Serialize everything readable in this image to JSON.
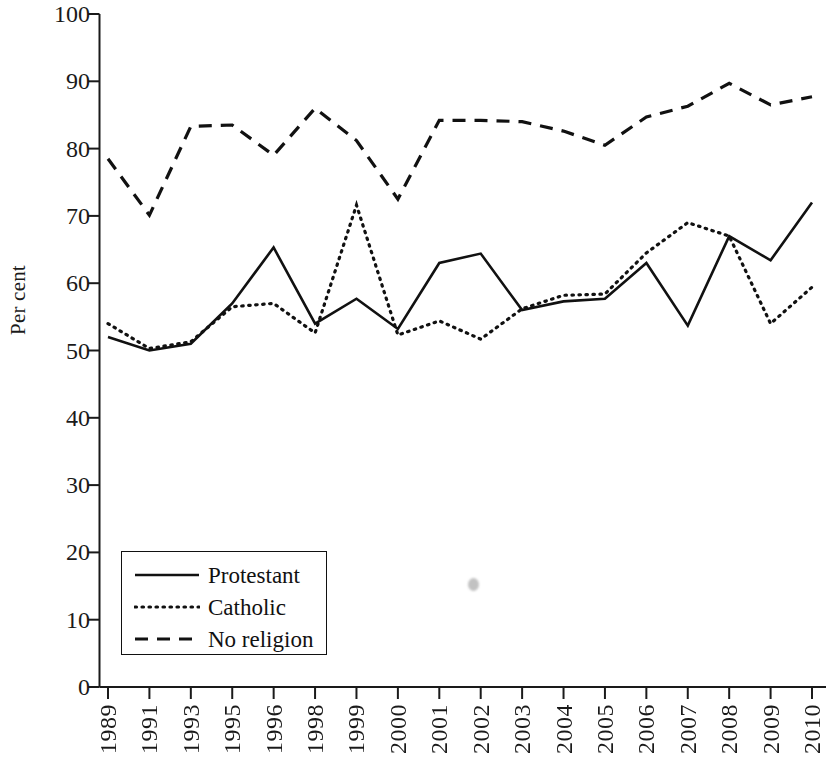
{
  "chart_data": {
    "type": "line",
    "title": "",
    "xlabel": "",
    "ylabel": "Per cent",
    "ylim": [
      0,
      100
    ],
    "ytick_values": [
      0,
      10,
      20,
      30,
      40,
      50,
      60,
      70,
      80,
      90,
      100
    ],
    "grid": false,
    "legend_position": "bottom-left",
    "categories": [
      "1989",
      "1991",
      "1993",
      "1995",
      "1996",
      "1998",
      "1999",
      "2000",
      "2001",
      "2002",
      "2003",
      "2004",
      "2005",
      "2006",
      "2007",
      "2008",
      "2009",
      "2010"
    ],
    "series": [
      {
        "name": "Protestant",
        "style": "solid",
        "color": "#111111",
        "values": [
          52,
          50,
          51,
          57,
          65.3,
          54,
          57.7,
          53.2,
          63,
          64.4,
          56,
          57.3,
          57.7,
          63,
          53.7,
          67,
          63.4,
          72
        ]
      },
      {
        "name": "Catholic",
        "style": "dotted",
        "color": "#111111",
        "values": [
          54,
          50.3,
          51.3,
          56.5,
          57,
          52.6,
          71.6,
          52.3,
          54.4,
          51.7,
          56.2,
          58.2,
          58.4,
          64.5,
          69,
          67,
          54,
          59.4
        ]
      },
      {
        "name": "No religion",
        "style": "dashed",
        "color": "#111111",
        "values": [
          78.5,
          70.1,
          83.3,
          83.5,
          79,
          86,
          81.2,
          72.5,
          84.2,
          84.2,
          84,
          82.6,
          80.5,
          84.7,
          86.3,
          89.7,
          86.5,
          87.7
        ]
      }
    ],
    "legend": [
      {
        "label": "Protestant",
        "style": "solid"
      },
      {
        "label": "Catholic",
        "style": "dotted"
      },
      {
        "label": "No religion",
        "style": "dashed"
      }
    ]
  },
  "axis": {
    "y_title": "Per cent",
    "y_ticks": [
      "100",
      "90",
      "80",
      "70",
      "60",
      "50",
      "40",
      "30",
      "20",
      "10",
      "0"
    ],
    "x_ticks": [
      "1989",
      "1991",
      "1993",
      "1995",
      "1996",
      "1998",
      "1999",
      "2000",
      "2001",
      "2002",
      "2003",
      "2004",
      "2005",
      "2006",
      "2007",
      "2008",
      "2009",
      "2010"
    ]
  }
}
